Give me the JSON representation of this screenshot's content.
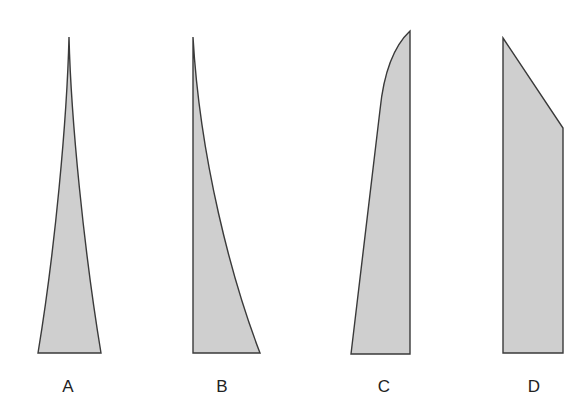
{
  "diagram": {
    "fill_color": "#cfcfcf",
    "stroke_color": "#3a3a3a",
    "shapes": [
      {
        "id": "A",
        "label": "A",
        "form": "symmetric concave taper to a point at top",
        "path": "M 69 37 C 67 120, 55 250, 38 353 L 101 353 C 84 250, 71 120, 69 37 Z",
        "label_pos": [
          68,
          392
        ]
      },
      {
        "id": "B",
        "label": "B",
        "form": "vertical left edge, concave right edge tapering to a point at top",
        "path": "M 193 37 L 193 353 L 260 353 C 232 280, 200 160, 193 37 Z",
        "label_pos": [
          222,
          392
        ]
      },
      {
        "id": "C",
        "label": "C",
        "form": "vertical right edge, straight slanted left edge with rounded convex top",
        "path": "M 410 31 L 410 354 L 351 354 L 380 110 C 384 70, 395 45, 410 31 Z",
        "label_pos": [
          384,
          392
        ]
      },
      {
        "id": "D",
        "label": "D",
        "form": "vertical left and right edges with a straight diagonal cut at top",
        "path": "M 503 38 L 563 128 L 563 353 L 503 353 Z",
        "label_pos": [
          534,
          392
        ]
      }
    ]
  }
}
